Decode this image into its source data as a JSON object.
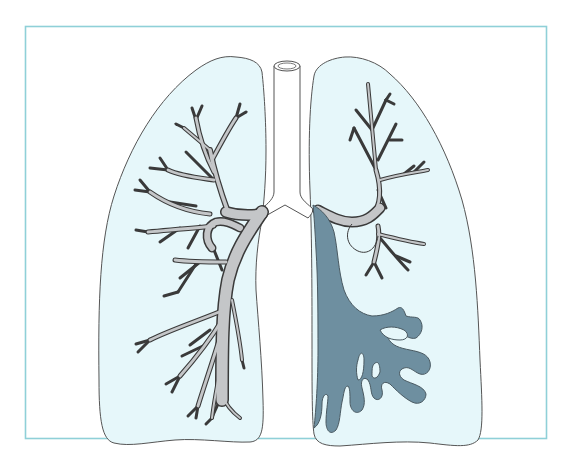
{
  "figure": {
    "title": "",
    "regions": [
      {
        "name": "trachea",
        "label": ""
      },
      {
        "name": "left-lung-viewer",
        "label": ""
      },
      {
        "name": "right-lung-viewer",
        "label": ""
      },
      {
        "name": "normal-bronchi",
        "label": ""
      },
      {
        "name": "dilated-bronchi",
        "label": ""
      }
    ]
  },
  "colors": {
    "frame_border": "#8fd0d8",
    "lung_fill": "#e6f7fa",
    "lung_outline": "#555555",
    "bronchi_fill": "#c4c6c8",
    "bronchi_outline": "#3a3a3a",
    "diseased_fill": "#6e8fa0"
  }
}
